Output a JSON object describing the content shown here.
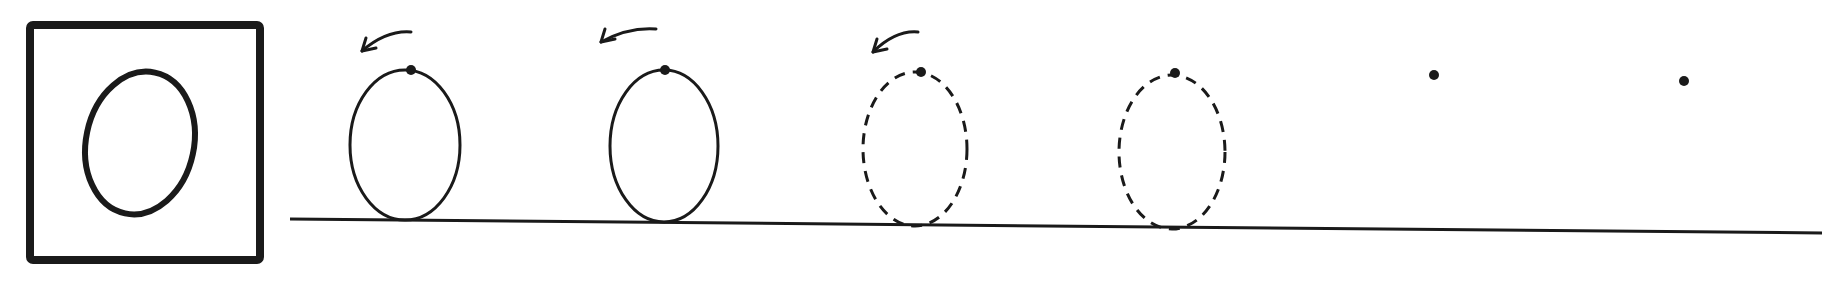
{
  "worksheet": {
    "subject": "Handwriting practice",
    "letter": "O",
    "ink_color": "#1a1a1a",
    "paper_color": "#ffffff",
    "model_box": {
      "x": 30,
      "y": 25,
      "w": 230,
      "h": 235,
      "stroke_width": 8,
      "letter": {
        "cx": 140,
        "cy": 143,
        "rx": 54,
        "ry": 72,
        "rotate": 12,
        "stroke_width": 6
      }
    },
    "baseline": {
      "x1": 290,
      "y1": 219,
      "x2": 1822,
      "y2": 233,
      "stroke_width": 3
    },
    "practice_items": [
      {
        "type": "solid",
        "cx": 405,
        "cy": 145,
        "rx": 55,
        "ry": 75,
        "start_dot": [
          411,
          70
        ],
        "arrow": {
          "from": [
            411,
            32
          ],
          "to": [
            362,
            51
          ]
        }
      },
      {
        "type": "solid",
        "cx": 664,
        "cy": 146,
        "rx": 54,
        "ry": 76,
        "start_dot": [
          665,
          70
        ],
        "arrow": {
          "from": [
            656,
            29
          ],
          "to": [
            601,
            42
          ]
        }
      },
      {
        "type": "dashed",
        "cx": 915,
        "cy": 149,
        "rx": 52,
        "ry": 77,
        "start_dot": [
          921,
          72
        ],
        "arrow": {
          "from": [
            918,
            32
          ],
          "to": [
            873,
            52
          ]
        }
      },
      {
        "type": "dashed",
        "cx": 1172,
        "cy": 152,
        "rx": 53,
        "ry": 77,
        "start_dot": [
          1175,
          73
        ],
        "arrow": null
      },
      {
        "type": "dot-only",
        "start_dot": [
          1434,
          75
        ]
      },
      {
        "type": "dot-only",
        "start_dot": [
          1684,
          81
        ]
      }
    ]
  }
}
